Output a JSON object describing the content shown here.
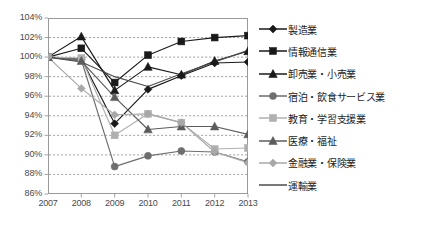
{
  "chart_data": {
    "type": "line",
    "title": "",
    "xlabel": "",
    "ylabel": "",
    "x": [
      "2007",
      "2008",
      "2009",
      "2010",
      "2011",
      "2012",
      "2013"
    ],
    "ylim": [
      86,
      104
    ],
    "ytick_labels": [
      "104%",
      "102%",
      "100%",
      "98%",
      "96%",
      "94%",
      "92%",
      "90%",
      "88%",
      "86%"
    ],
    "ytick_values": [
      104,
      102,
      100,
      98,
      96,
      94,
      92,
      90,
      88,
      86
    ],
    "grid": true,
    "legend_position": "right",
    "value_suffix": "%",
    "series": [
      {
        "name": "製造業",
        "marker": "diamond",
        "color": "#1a1a1a",
        "values": [
          100.0,
          99.8,
          93.2,
          96.7,
          98.1,
          99.4,
          99.5
        ]
      },
      {
        "name": "情報通信業",
        "marker": "square",
        "color": "#1a1a1a",
        "values": [
          100.0,
          100.9,
          97.4,
          100.2,
          101.6,
          102.0,
          102.2
        ]
      },
      {
        "name": "卸売業・小売業",
        "marker": "triangle",
        "color": "#1a1a1a",
        "values": [
          100.0,
          102.1,
          96.6,
          99.0,
          98.2,
          99.6,
          100.6
        ]
      },
      {
        "name": "宿泊・飲食サービス業",
        "marker": "circle",
        "color": "#6e6e6e",
        "values": [
          100.0,
          99.7,
          88.8,
          89.9,
          90.4,
          90.3,
          89.3
        ]
      },
      {
        "name": "教育・学習支援業",
        "marker": "square",
        "color": "#b0b0b0",
        "values": [
          100.0,
          99.9,
          92.0,
          94.2,
          93.3,
          90.6,
          90.7
        ]
      },
      {
        "name": "医療・福祉",
        "marker": "triangle",
        "color": "#5c5c5c",
        "values": [
          100.0,
          99.6,
          95.9,
          92.6,
          92.9,
          92.9,
          92.1
        ]
      },
      {
        "name": "金融業・保険業",
        "marker": "diamond",
        "color": "#a8a8a8",
        "values": [
          100.0,
          96.8,
          94.1,
          94.2,
          93.3,
          90.3,
          89.2
        ]
      },
      {
        "name": "運輸業",
        "marker": "none",
        "color": "#4d4d4d",
        "values": [
          100.0,
          99.5,
          98.0,
          97.0,
          98.3,
          99.5,
          100.7
        ]
      }
    ]
  }
}
